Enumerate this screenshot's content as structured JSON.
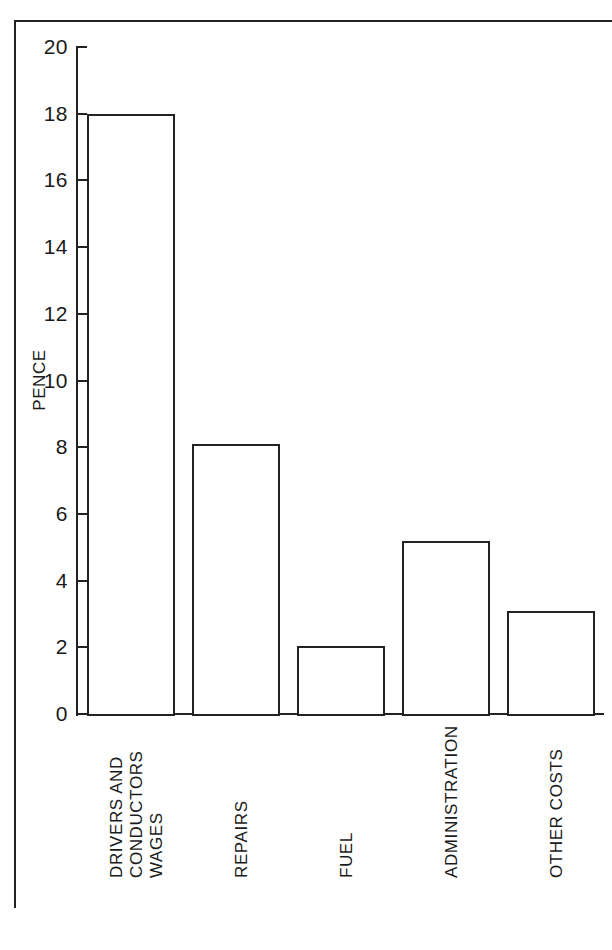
{
  "chart_data": {
    "type": "bar",
    "title": "",
    "subtitle": "",
    "xlabel": "",
    "ylabel": "PENCE",
    "ylim": [
      0,
      20
    ],
    "ytick_step": 2,
    "yticks": [
      20,
      18,
      16,
      14,
      12,
      10,
      8,
      6,
      4,
      2,
      0
    ],
    "ytick_labels": [
      "20",
      "18",
      "16",
      "14",
      "12",
      "10",
      "8",
      "6",
      "4",
      "2",
      "0"
    ],
    "grid": false,
    "legend": false,
    "legend_position": "none",
    "categories": [
      "DRIVERS AND CONDUCTORS WAGES",
      "REPAIRS",
      "FUEL",
      "ADMINISTRATION",
      "OTHER COSTS"
    ],
    "category_lines": [
      [
        "DRIVERS AND",
        "CONDUCTORS",
        "WAGES"
      ],
      [
        "REPAIRS"
      ],
      [
        "FUEL"
      ],
      [
        "ADMINISTRATION"
      ],
      [
        "OTHER COSTS"
      ]
    ],
    "values": [
      18.0,
      8.1,
      2.05,
      5.2,
      3.1
    ],
    "bar_color": "#ffffff",
    "bar_edge_color": "#222222",
    "axis_color": "#222222",
    "background_color": "#ffffff"
  },
  "axis": {
    "y_title": "PENCE"
  }
}
